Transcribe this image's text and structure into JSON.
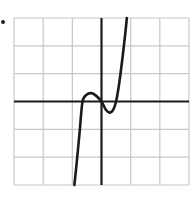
{
  "chart_data": {
    "type": "line",
    "title": "",
    "xlabel": "",
    "ylabel": "",
    "xlim": [
      -3,
      3
    ],
    "ylim": [
      -3,
      3
    ],
    "grid": true,
    "grid_cells": [
      6,
      6
    ],
    "axes_at_origin": true,
    "legend": null,
    "series": [
      {
        "name": "cubic curve",
        "description": "cubic with zeros near x = -0.65, 0, 0.5; local max near (-0.35, 0.3); local min near (0.28, -0.4)",
        "points": [
          [
            -0.93,
            -3.0
          ],
          [
            -0.85,
            -2.2
          ],
          [
            -0.75,
            -1.1
          ],
          [
            -0.65,
            0.0
          ],
          [
            -0.5,
            0.25
          ],
          [
            -0.35,
            0.3
          ],
          [
            -0.2,
            0.22
          ],
          [
            0.0,
            0.0
          ],
          [
            0.15,
            -0.3
          ],
          [
            0.28,
            -0.4
          ],
          [
            0.4,
            -0.3
          ],
          [
            0.5,
            0.0
          ],
          [
            0.6,
            0.6
          ],
          [
            0.7,
            1.4
          ],
          [
            0.8,
            2.3
          ],
          [
            0.87,
            3.0
          ]
        ],
        "color": "#1a1a1a"
      }
    ]
  },
  "colors": {
    "grid": "#c8c8c8",
    "axes": "#1a1a1a",
    "curve": "#1a1a1a",
    "background": "#ffffff"
  }
}
